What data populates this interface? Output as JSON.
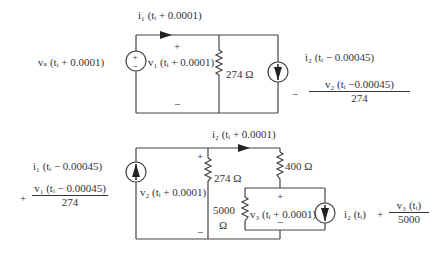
{
  "top_circuit": {
    "current_label": "i₁ (tᵢ + 0.0001)",
    "source_label": "vₛ (tᵢ + 0.0001)",
    "voltage_label": "v₁ (tᵢ + 0.0001)",
    "resistor_label": "274 Ω",
    "plus": "+",
    "minus": "−",
    "source_plus": "+",
    "source_minus": "−",
    "current_source_label": "i₂ (tᵢ − 0.00045)",
    "expr_sign": "−",
    "expr_numerator": "v₂ (tᵢ −0.00045)",
    "expr_denominator": "274"
  },
  "bottom_circuit": {
    "current_label": "i₂ (tᵢ + 0.0001)",
    "source_expr_top": "i₁ (tᵢ − 0.00045)",
    "source_expr_sign": "+",
    "source_expr_numerator": "v₁ (tᵢ − 0.00045)",
    "source_expr_denominator": "274",
    "voltage2_label": "v₂ (tᵢ + 0.0001)",
    "plus": "+",
    "minus": "−",
    "resistor_274": "274 Ω",
    "resistor_400": "400 Ω",
    "resistor_5000_top": "5000",
    "resistor_5000_unit": "Ω",
    "voltage3_label": "v₃ (tᵢ + 0.0001)",
    "plus3": "+",
    "minus3": "−",
    "right_expr_lhs": "i₂ (tᵢ)",
    "right_expr_sign": "+",
    "right_expr_numerator": "v₃ (tᵢ)",
    "right_expr_denominator": "5000"
  }
}
